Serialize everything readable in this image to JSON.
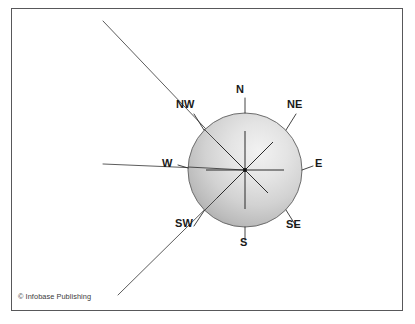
{
  "figure": {
    "type": "compass-rose-diagram",
    "background_color": "#ffffff",
    "frame": {
      "border_color": "#58585a",
      "border_width_px": 1.4
    }
  },
  "compass": {
    "center": {
      "x": 245,
      "y": 170
    },
    "radius": 57,
    "circle_fill_light": "#f0f0f0",
    "circle_fill_dark": "#a9a9a9",
    "circle_stroke": "#6d6d6d",
    "spoke_color": "#2a2a2a",
    "center_dot_color": "#111111",
    "labels": [
      {
        "name": "N",
        "text": "N",
        "x": 238,
        "y": 86,
        "bearing_deg": 0,
        "tick": true
      },
      {
        "name": "NE",
        "text": "NE",
        "x": 286,
        "y": 100,
        "bearing_deg": 45,
        "tick": true
      },
      {
        "name": "E",
        "text": "E",
        "x": 314,
        "y": 159,
        "bearing_deg": 90,
        "tick": true
      },
      {
        "name": "SE",
        "text": "SE",
        "x": 286,
        "y": 218,
        "bearing_deg": 135,
        "tick": true
      },
      {
        "name": "S",
        "text": "S",
        "x": 240,
        "y": 236,
        "bearing_deg": 180,
        "tick": true
      },
      {
        "name": "SW",
        "text": "SW",
        "x": 174,
        "y": 218,
        "bearing_deg": 225,
        "tick": true
      },
      {
        "name": "W",
        "text": "W",
        "x": 163,
        "y": 159,
        "bearing_deg": 270,
        "tick": true
      },
      {
        "name": "NW",
        "text": "NW",
        "x": 176,
        "y": 100,
        "bearing_deg": 315,
        "tick": true
      }
    ]
  },
  "rays": {
    "stroke_color": "#4a4a4a",
    "stroke_width": 0.9,
    "lines": [
      {
        "name": "nw-extension-ray",
        "x1": 103,
        "y1": 21,
        "x2": 222,
        "y2": 147
      },
      {
        "name": "sw-extension-ray",
        "x1": 118,
        "y1": 295,
        "x2": 218,
        "y2": 197
      },
      {
        "name": "west-extension-ray",
        "x1": 103,
        "y1": 164,
        "x2": 196,
        "y2": 164
      }
    ]
  },
  "credit": {
    "text": "© Infobase Publishing",
    "color": "#3a3a3a"
  }
}
